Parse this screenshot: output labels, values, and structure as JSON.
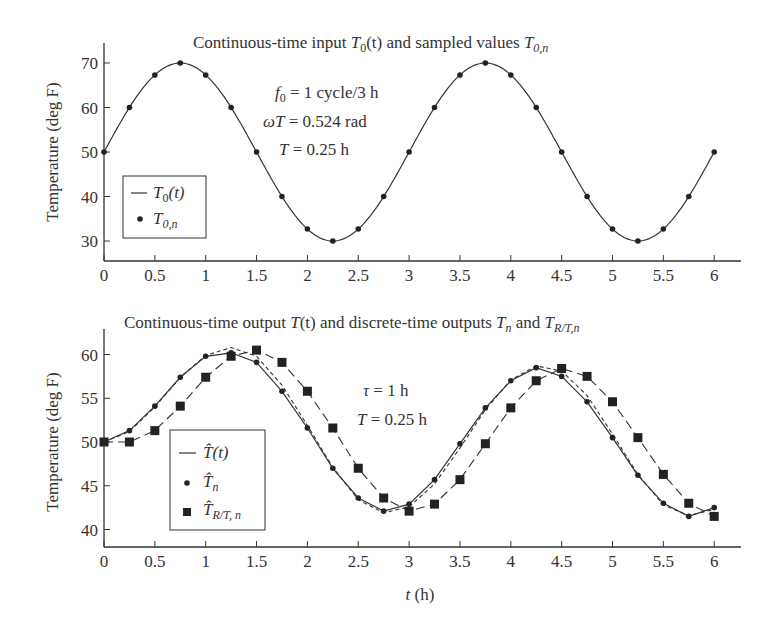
{
  "chart_data": [
    {
      "type": "line",
      "title": "Continuous-time input T0(t) and sampled values T0,n",
      "title_parts": {
        "pre": "Continuous-time input ",
        "sym1": "T",
        "sub1": "0",
        "mid1": "(t)",
        "post": " and sampled values ",
        "sym2": "T",
        "sub2": "0,n"
      },
      "xlabel": "",
      "ylabel": "Temperature (deg F)",
      "xlim": [
        0,
        6.25
      ],
      "ylim": [
        25,
        75
      ],
      "xticks": [
        "0",
        "0.5",
        "1",
        "1.5",
        "2",
        "2.5",
        "3",
        "3.5",
        "4",
        "4.5",
        "5",
        "5.5",
        "6"
      ],
      "yticks": [
        "30",
        "40",
        "50",
        "60",
        "70"
      ],
      "grid": false,
      "legend": {
        "position": "lower-left",
        "entries": [
          {
            "marker": "line",
            "sym": "T",
            "sub": "0",
            "suffix": "(t)"
          },
          {
            "marker": "dot",
            "sym": "T",
            "sub": "0,n",
            "suffix": ""
          }
        ]
      },
      "annotations": {
        "f0": {
          "sym": "f",
          "sub": "0",
          "text": " = 1 cycle/3 h"
        },
        "omegaT": {
          "sym": "ωT",
          "text": " = 0.524 rad"
        },
        "T": {
          "sym": "T",
          "text": " = 0.25 h"
        }
      },
      "x": [
        0,
        0.25,
        0.5,
        0.75,
        1,
        1.25,
        1.5,
        1.75,
        2,
        2.25,
        2.5,
        2.75,
        3,
        3.25,
        3.5,
        3.75,
        4,
        4.25,
        4.5,
        4.75,
        5,
        5.25,
        5.5,
        5.75,
        6
      ],
      "series": [
        {
          "name": "T0(t)",
          "style": "solid-line",
          "formula": "50 + 20*sin(2*pi*t/3)"
        },
        {
          "name": "T0,n",
          "style": "dots",
          "values": [
            50,
            60,
            67.3,
            70,
            67.3,
            60,
            50,
            40,
            32.7,
            30,
            32.7,
            40,
            50,
            60,
            67.3,
            70,
            67.3,
            60,
            50,
            40,
            32.7,
            30,
            32.7,
            40,
            50
          ]
        }
      ]
    },
    {
      "type": "line",
      "title": "Continuous-time output T(t) and discrete-time outputs Tn and TR/T,n",
      "title_parts": {
        "pre": "Continuous-time output ",
        "sym1": "T",
        "mid1": "(t)",
        "mid2": " and discrete-time outputs ",
        "sym2": "T",
        "sub2": "n",
        "mid3": " and ",
        "sym3": "T",
        "sub3": "R/T,n"
      },
      "xlabel": "t (h)",
      "xlabel_parts": {
        "sym": "t",
        "unit": " (h)"
      },
      "ylabel": "Temperature (deg F)",
      "xlim": [
        0,
        6.25
      ],
      "ylim": [
        38,
        62.5
      ],
      "xticks": [
        "0",
        "0.5",
        "1",
        "1.5",
        "2",
        "2.5",
        "3",
        "3.5",
        "4",
        "4.5",
        "5",
        "5.5",
        "6"
      ],
      "yticks": [
        "40",
        "45",
        "50",
        "55",
        "60"
      ],
      "grid": false,
      "legend": {
        "position": "lower-left",
        "entries": [
          {
            "marker": "line",
            "sym": "T̂",
            "sub": "",
            "suffix": "(t)"
          },
          {
            "marker": "dot",
            "sym": "T̂",
            "sub": "n",
            "suffix": ""
          },
          {
            "marker": "square",
            "sym": "T̂",
            "sub": "R/T, n",
            "suffix": ""
          }
        ]
      },
      "annotations": {
        "tau": {
          "sym": "τ",
          "text": " = 1 h"
        },
        "T": {
          "sym": "T",
          "text": " = 0.25 h"
        }
      },
      "x": [
        0,
        0.25,
        0.5,
        0.75,
        1,
        1.25,
        1.5,
        1.75,
        2,
        2.25,
        2.5,
        2.75,
        3,
        3.25,
        3.5,
        3.75,
        4,
        4.25,
        4.5,
        4.75,
        5,
        5.25,
        5.5,
        5.75,
        6
      ],
      "series": [
        {
          "name": "T(t) continuous output",
          "style": "short-dash",
          "values": [
            50,
            51.2,
            54.0,
            57.4,
            59.9,
            60.8,
            59.8,
            56.5,
            51.9,
            47.1,
            43.4,
            41.9,
            42.6,
            45.2,
            49.3,
            53.7,
            57.1,
            58.7,
            58.1,
            55.3,
            50.9,
            46.3,
            42.8,
            41.6,
            42.3
          ]
        },
        {
          "name": "T̂(t)",
          "style": "solid-line",
          "values": [
            50,
            51.3,
            54.1,
            57.4,
            59.8,
            60.2,
            59.1,
            55.8,
            51.6,
            47.0,
            43.6,
            42.1,
            42.9,
            45.7,
            49.8,
            53.9,
            57.0,
            58.5,
            57.5,
            54.6,
            50.5,
            46.2,
            43.0,
            41.5,
            42.5
          ]
        },
        {
          "name": "T̂n",
          "style": "dots",
          "values": [
            50,
            51.3,
            54.1,
            57.4,
            59.8,
            60.2,
            59.1,
            55.8,
            51.6,
            47.0,
            43.6,
            42.1,
            42.9,
            45.7,
            49.8,
            53.9,
            57.0,
            58.5,
            57.5,
            54.6,
            50.5,
            46.2,
            43.0,
            41.5,
            42.5
          ]
        },
        {
          "name": "T̂R/T,n",
          "style": "squares-long-dash",
          "values": [
            50,
            50,
            51.3,
            54.1,
            57.4,
            59.8,
            60.5,
            59.1,
            55.8,
            51.6,
            47.0,
            43.6,
            42.1,
            42.9,
            45.7,
            49.8,
            53.9,
            57.0,
            58.4,
            57.5,
            54.6,
            50.5,
            46.3,
            43.0,
            41.5
          ]
        }
      ]
    }
  ]
}
